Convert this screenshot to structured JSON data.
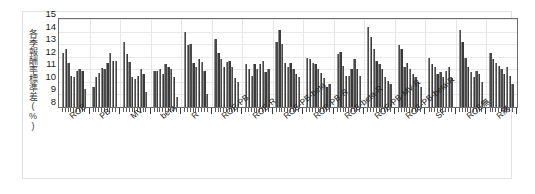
{
  "figure": {
    "background_color": "#ffffff",
    "frame_color": "#e2e2e2",
    "bar_color": "#4a4a4a",
    "axis_color": "#6e6e6e"
  },
  "chart_data": {
    "type": "bar",
    "title": "",
    "subtitle": "",
    "xlabel": "",
    "ylabel": "各季報酬率標準差(%)",
    "ylim": [
      8,
      15
    ],
    "yticks": [
      8,
      9,
      10,
      11,
      12,
      13,
      14,
      15
    ],
    "ytick_labels": [
      "8",
      "9",
      "10",
      "11",
      "12",
      "13",
      "14",
      "15"
    ],
    "grid": true,
    "legend": "none",
    "bars_per_group": 9,
    "categories": [
      "ROE",
      "PB",
      "MV",
      "beta",
      "R",
      "ROE-PB",
      "ROE-R",
      "ROE-PB-beta",
      "ROE-PB-R",
      "ROE-beta-R",
      "ROE-PB-MV-R",
      "ROE-PB-beta-R",
      "SF",
      "ROE無",
      "R無"
    ],
    "groups": [
      {
        "category": "ROE",
        "values": [
          12.3,
          12.6,
          11.5,
          10.5,
          10.4,
          10.9,
          11.0,
          10.9,
          9.4
        ]
      },
      {
        "category": "PB",
        "values": [
          9.6,
          10.4,
          10.7,
          11.1,
          11.0,
          11.5,
          12.3,
          11.7,
          11.7
        ]
      },
      {
        "category": "MV",
        "values": [
          13.2,
          12.2,
          11.6,
          10.4,
          10.2,
          10.5,
          11.0,
          10.6,
          9.2
        ]
      },
      {
        "category": "beta",
        "values": [
          10.9,
          10.9,
          11.0,
          10.6,
          11.4,
          11.2,
          11.0,
          10.4,
          8.8
        ]
      },
      {
        "category": "R",
        "values": [
          14.0,
          12.9,
          13.0,
          11.5,
          11.2,
          11.8,
          11.6,
          10.9,
          9.0
        ]
      },
      {
        "category": "ROE-PB",
        "values": [
          13.4,
          12.3,
          11.8,
          11.2,
          11.6,
          11.7,
          11.2,
          10.3,
          10.0
        ]
      },
      {
        "category": "ROE-R",
        "values": [
          11.4,
          11.0,
          10.5,
          11.4,
          11.0,
          11.4,
          11.7,
          10.8,
          11.0
        ]
      },
      {
        "category": "ROE-PB-beta",
        "values": [
          13.2,
          14.1,
          13.0,
          11.5,
          11.2,
          11.5,
          11.0,
          10.6,
          10.4
        ]
      },
      {
        "category": "ROE-PB-R",
        "values": [
          11.9,
          11.8,
          11.5,
          11.4,
          11.0,
          10.7,
          10.3,
          9.6,
          9.8
        ]
      },
      {
        "category": "ROE-beta-R",
        "values": [
          12.2,
          12.4,
          11.3,
          10.5,
          10.5,
          11.0,
          11.8,
          11.0,
          10.5
        ]
      },
      {
        "category": "ROE-PB-MV-R",
        "values": [
          14.4,
          13.6,
          12.6,
          11.7,
          11.4,
          11.0,
          10.4,
          10.1,
          9.8
        ]
      },
      {
        "category": "ROE-PB-beta-R",
        "values": [
          12.9,
          12.6,
          11.2,
          11.5,
          11.0,
          10.6,
          10.4,
          10.0,
          9.6
        ]
      },
      {
        "category": "SF",
        "values": [
          11.9,
          11.4,
          11.2,
          10.6,
          10.8,
          10.4,
          10.9,
          11.2,
          10.3
        ]
      },
      {
        "category": "ROE無",
        "values": [
          14.1,
          13.2,
          11.9,
          11.2,
          10.8,
          10.4,
          10.9,
          10.6,
          10.0
        ]
      },
      {
        "category": "R無",
        "values": [
          12.3,
          11.8,
          11.5,
          11.3,
          11.0,
          10.6,
          11.2,
          10.5,
          9.8
        ]
      }
    ]
  }
}
